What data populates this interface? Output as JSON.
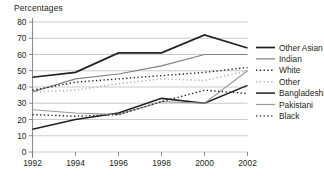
{
  "chart_data": {
    "type": "line",
    "title": "Percentages",
    "xlabel": "",
    "ylabel": "",
    "xlim": [
      1992,
      2002
    ],
    "ylim": [
      0,
      80
    ],
    "ytick_step": 10,
    "grid": "horizontal",
    "legend_position": "right",
    "x": [
      1992,
      1994,
      1996,
      1998,
      2000,
      2002
    ],
    "categories": [
      "1992",
      "1994",
      "1996",
      "1998",
      "2000",
      "2002"
    ],
    "yticks": [
      "0",
      "10",
      "20",
      "30",
      "40",
      "50",
      "60",
      "70",
      "80"
    ],
    "series": [
      {
        "name": "Other Asian",
        "values": [
          46,
          49,
          61,
          61,
          72,
          64
        ],
        "style": "solid",
        "color": "#231f20",
        "width": 1.7
      },
      {
        "name": "Indian",
        "values": [
          37,
          45,
          48,
          53,
          60,
          60
        ],
        "style": "solid",
        "color": "#808080",
        "width": 1.2
      },
      {
        "name": "White",
        "values": [
          38,
          43,
          45,
          47,
          49,
          52
        ],
        "style": "dotted",
        "color": "#231f20",
        "width": 1.4
      },
      {
        "name": "Other",
        "values": [
          37,
          38,
          42,
          45,
          44,
          50
        ],
        "style": "dotted",
        "color": "#b0b0b0",
        "width": 1.4
      },
      {
        "name": "Bangladeshi",
        "values": [
          14,
          20,
          24,
          33,
          30,
          41
        ],
        "style": "solid",
        "color": "#231f20",
        "width": 1.5
      },
      {
        "name": "Pakistani",
        "values": [
          26,
          24,
          23,
          31,
          30,
          50
        ],
        "style": "solid",
        "color": "#9a9a9a",
        "width": 1.2
      },
      {
        "name": "Black",
        "values": [
          23,
          22,
          23,
          31,
          38,
          36
        ],
        "style": "dotted",
        "color": "#231f20",
        "width": 1.4
      }
    ]
  },
  "legend": {
    "entries": [
      {
        "label": "Other Asian"
      },
      {
        "label": "Indian"
      },
      {
        "label": "White"
      },
      {
        "label": "Other"
      },
      {
        "label": "Bangladeshi"
      },
      {
        "label": "Pakistani"
      },
      {
        "label": "Black"
      }
    ]
  },
  "colors": {
    "background": "#ffffff",
    "text": "#231f20",
    "gridline": "#b4b4b4",
    "axis": "#7d7d7d"
  }
}
